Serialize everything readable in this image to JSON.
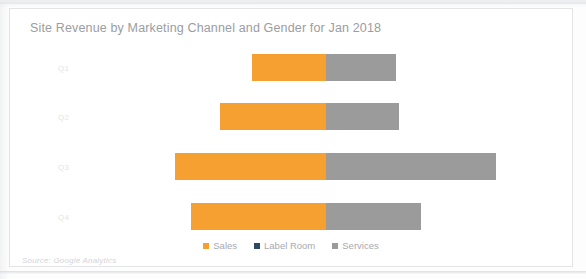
{
  "chart_data": {
    "type": "bar",
    "orientation": "horizontal",
    "variant": "diverging-stacked",
    "title": "Site Revenue by Marketing Channel and Gender for Jan 2018",
    "xlabel": "",
    "ylabel": "",
    "categories": [
      "Q1",
      "Q2",
      "Q3",
      "Q4"
    ],
    "baseline_x_px": 325,
    "grid": false,
    "legend_position": "bottom",
    "series": [
      {
        "name": "Sales",
        "color": "#f5a030",
        "direction": "left",
        "values": [
          74,
          106,
          151,
          135
        ]
      },
      {
        "name": "Label Room",
        "color": "#2e4a62",
        "direction": "left",
        "values": [
          0,
          0,
          0,
          0
        ]
      },
      {
        "name": "Services",
        "color": "#9b9b9b",
        "direction": "right",
        "values": [
          70,
          73,
          170,
          95
        ]
      }
    ],
    "bars": [
      {
        "category": "Q1",
        "sales_start": 251,
        "sales_end": 325,
        "services_start": 325,
        "services_end": 395
      },
      {
        "category": "Q2",
        "sales_start": 219,
        "sales_end": 325,
        "services_start": 325,
        "services_end": 398
      },
      {
        "category": "Q3",
        "sales_start": 174,
        "sales_end": 325,
        "services_start": 325,
        "services_end": 495
      },
      {
        "category": "Q4",
        "sales_start": 190,
        "sales_end": 325,
        "services_start": 325,
        "services_end": 420
      }
    ]
  },
  "legend": {
    "items": [
      {
        "label": "Sales",
        "color": "#f5a030"
      },
      {
        "label": "Label Room",
        "color": "#2e4a62"
      },
      {
        "label": "Services",
        "color": "#9b9b9b"
      }
    ]
  },
  "footer": {
    "source": "Source: Google Analytics"
  }
}
